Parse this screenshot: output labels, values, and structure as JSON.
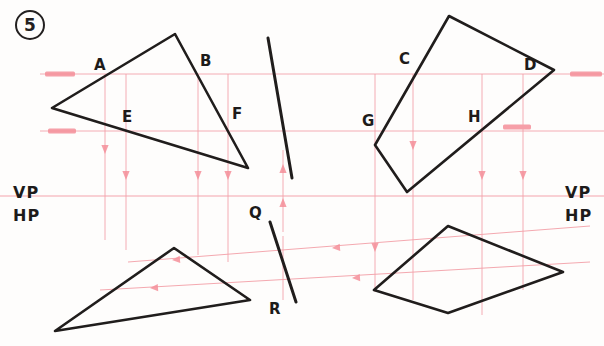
{
  "sheet": {
    "width": 604,
    "height": 346,
    "background": "#fefdfc",
    "problem_number": "5",
    "ink_color": "#201d1c",
    "projection_color": "#f4a0a8",
    "marker_color": "#f58e99"
  },
  "labels": {
    "vertices": [
      {
        "name": "label-A",
        "text": "A",
        "x": 94,
        "y": 56
      },
      {
        "name": "label-B",
        "text": "B",
        "x": 200,
        "y": 52
      },
      {
        "name": "label-E",
        "text": "E",
        "x": 122,
        "y": 108
      },
      {
        "name": "label-F",
        "text": "F",
        "x": 232,
        "y": 105
      },
      {
        "name": "label-C",
        "text": "C",
        "x": 399,
        "y": 50
      },
      {
        "name": "label-D",
        "text": "D",
        "x": 524,
        "y": 56
      },
      {
        "name": "label-G",
        "text": "G",
        "x": 362,
        "y": 112
      },
      {
        "name": "label-H",
        "text": "H",
        "x": 468,
        "y": 108
      },
      {
        "name": "label-Q",
        "text": "Q",
        "x": 249,
        "y": 204
      },
      {
        "name": "label-R",
        "text": "R",
        "x": 269,
        "y": 300
      }
    ],
    "planes": [
      {
        "name": "label-vp-left",
        "text": "VP",
        "x": 13,
        "y": 183
      },
      {
        "name": "label-hp-left",
        "text": "HP",
        "x": 13,
        "y": 206
      },
      {
        "name": "label-vp-right",
        "text": "VP",
        "x": 565,
        "y": 183
      },
      {
        "name": "label-hp-right",
        "text": "HP",
        "x": 565,
        "y": 206
      }
    ]
  },
  "figures": {
    "top_left_triangle": {
      "name": "triangle-ABE-top-view",
      "points": "52,108 175,34 248,168"
    },
    "bottom_left_triangle": {
      "name": "triangle-front-view-left",
      "points": "55,331 174,248 250,300"
    },
    "top_right_quad": {
      "name": "quadrilateral-CDGH-top-view",
      "points": "449,16 554,70 407,192 375,145"
    },
    "bottom_right_quad": {
      "name": "quadrilateral-front-view-right",
      "points": "448,226 563,272 448,313 374,290"
    },
    "line_upper": {
      "name": "oblique-line-upper",
      "x1": 268,
      "y1": 38,
      "x2": 292,
      "y2": 178
    },
    "line_QR": {
      "name": "oblique-line-QR",
      "x1": 270,
      "y1": 222,
      "x2": 296,
      "y2": 302
    }
  },
  "reference_lines": {
    "xy_line": {
      "name": "xy-ground-line",
      "y": 196,
      "x1": 0,
      "x2": 604
    },
    "horizontals": [
      {
        "name": "ref-line-upper",
        "y": 74,
        "x1": 40,
        "x2": 604
      },
      {
        "name": "ref-line-lower",
        "y": 131,
        "x1": 40,
        "x2": 604
      }
    ],
    "markers": [
      {
        "name": "ref-marker-left-upper",
        "x": 45,
        "y": 74,
        "w": 30
      },
      {
        "name": "ref-marker-left-lower",
        "x": 48,
        "y": 131,
        "w": 28
      },
      {
        "name": "ref-marker-right-upper",
        "x": 570,
        "y": 74,
        "w": 32
      },
      {
        "name": "ref-marker-right-lower",
        "x": 503,
        "y": 127,
        "w": 28
      }
    ],
    "projectors_down": [
      {
        "name": "projector-A",
        "x": 105,
        "y1": 74,
        "y2": 240,
        "arrow_y": 152
      },
      {
        "name": "projector-E",
        "x": 126,
        "y1": 74,
        "y2": 250,
        "arrow_y": 178
      },
      {
        "name": "projector-B",
        "x": 198,
        "y1": 74,
        "y2": 255,
        "arrow_y": 178
      },
      {
        "name": "projector-F",
        "x": 228,
        "y1": 74,
        "y2": 262,
        "arrow_y": 178
      },
      {
        "name": "projector-G",
        "x": 375,
        "y1": 74,
        "y2": 292,
        "arrow_y": 250
      },
      {
        "name": "projector-C",
        "x": 413,
        "y1": 74,
        "y2": 300,
        "arrow_y": 148
      },
      {
        "name": "projector-H",
        "x": 482,
        "y1": 74,
        "y2": 315,
        "arrow_y": 178
      },
      {
        "name": "projector-D",
        "x": 523,
        "y1": 74,
        "y2": 290,
        "arrow_y": 178
      }
    ],
    "projectors_up": [
      {
        "name": "projector-up-Q",
        "x": 283,
        "y1": 232,
        "y2": 150,
        "arrow_y": 166
      },
      {
        "name": "projector-up-R",
        "x": 283,
        "y1": 300,
        "y2": 236,
        "arrow_y": 200
      }
    ],
    "transfer_lines": [
      {
        "name": "transfer-line-upper",
        "x1": 590,
        "y1": 226,
        "x2": 128,
        "y2": 262,
        "arrows": [
          {
            "x": 332,
            "y": 248
          },
          {
            "x": 172,
            "y": 260
          }
        ]
      },
      {
        "name": "transfer-line-lower",
        "x1": 590,
        "y1": 262,
        "x2": 100,
        "y2": 290,
        "arrows": [
          {
            "x": 352,
            "y": 278
          },
          {
            "x": 150,
            "y": 288
          }
        ]
      }
    ]
  }
}
